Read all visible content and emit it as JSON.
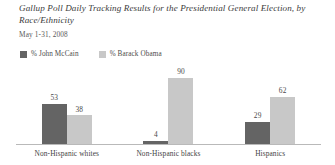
{
  "chart_data": {
    "type": "bar",
    "title": "Gallup Poll Daily Tracking Results for the Presidential General Election, by Race/Ethnicity",
    "subtitle": "May 1-31, 2008",
    "categories": [
      "Non-Hispanic whites",
      "Non-Hispanic blacks",
      "Hispanics"
    ],
    "series": [
      {
        "name": "% John McCain",
        "color": "#646464",
        "values": [
          53,
          4,
          29
        ]
      },
      {
        "name": "% Barack Obama",
        "color": "#c8c8c8",
        "values": [
          38,
          90,
          62
        ]
      }
    ],
    "xlabel": "",
    "ylabel": "",
    "ylim": [
      0,
      100
    ],
    "grid": false,
    "legend_position": "top-left",
    "value_labels": true,
    "axis_line": true
  },
  "legend": {
    "items": [
      {
        "label": "% John McCain",
        "swatch": "#646464"
      },
      {
        "label": "% Barack Obama",
        "swatch": "#c8c8c8"
      }
    ]
  }
}
